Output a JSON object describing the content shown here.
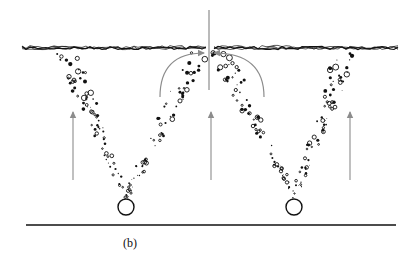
{
  "figure": {
    "label": "(b)",
    "colors": {
      "ink": "#111111",
      "arrow": "#8c8c8c",
      "background": "#ffffff"
    },
    "surface": {
      "y": 48,
      "x_start": 22,
      "x_end": 400,
      "gap": [
        206,
        214
      ]
    },
    "divider": {
      "x": 209,
      "y_top": 10,
      "y_bottom": 90
    },
    "floor": {
      "y": 225,
      "x_start": 26,
      "x_end": 396
    },
    "sources": [
      {
        "name": "left-source",
        "cx": 126,
        "cy": 207,
        "r": 8,
        "plume_left_top": [
          68,
          55
        ],
        "plume_right_top": [
          200,
          52
        ]
      },
      {
        "name": "right-source",
        "cx": 294,
        "cy": 207,
        "r": 8,
        "plume_left_top": [
          220,
          52
        ],
        "plume_right_top": [
          345,
          54
        ]
      }
    ],
    "up_arrows": [
      {
        "name": "left-upflow-arrow",
        "x": 73,
        "y_top": 112,
        "y_bottom": 180
      },
      {
        "name": "center-upflow-arrow",
        "x": 211,
        "y_top": 112,
        "y_bottom": 180
      },
      {
        "name": "right-upflow-arrow",
        "x": 350,
        "y_top": 112,
        "y_bottom": 180
      }
    ],
    "circulation_arcs": [
      {
        "name": "left-circulation-arrow",
        "from": [
          160,
          97
        ],
        "to": [
          204,
          53
        ],
        "direction": "right"
      },
      {
        "name": "right-circulation-arrow",
        "from": [
          264,
          97
        ],
        "to": [
          214,
          53
        ],
        "direction": "left"
      }
    ]
  }
}
